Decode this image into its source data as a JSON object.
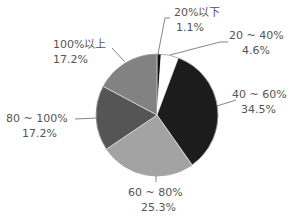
{
  "chart_data": {
    "type": "pie",
    "title": "",
    "start": "top",
    "direction": "clockwise",
    "slices": [
      {
        "label": "20%以下",
        "value": 1.1,
        "value_label": "1.1%",
        "color": "#111111"
      },
      {
        "label": "20 ~ 40%",
        "value": 4.6,
        "value_label": "4.6%",
        "color": "#ffffff"
      },
      {
        "label": "40 ~ 60%",
        "value": 34.5,
        "value_label": "34.5%",
        "color": "#1c1c1c"
      },
      {
        "label": "60 ~ 80%",
        "value": 25.3,
        "value_label": "25.3%",
        "color": "#a3a3a3"
      },
      {
        "label": "80 ~ 100%",
        "value": 17.2,
        "value_label": "17.2%",
        "color": "#555555"
      },
      {
        "label": "100%以上",
        "value": 17.2,
        "value_label": "17.2%",
        "color": "#828282"
      }
    ],
    "legend": "none",
    "label_style": "outside-with-leader-lines"
  }
}
